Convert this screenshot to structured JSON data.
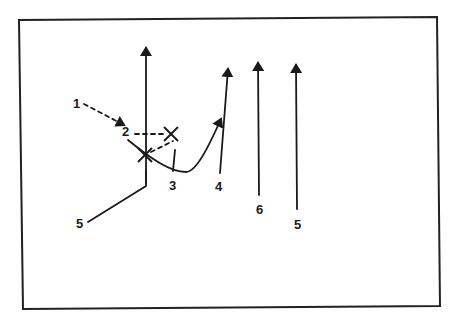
{
  "diagram": {
    "type": "play-diagram",
    "colors": {
      "ink": "#1a1a1a",
      "frame": "#222222",
      "background": "#ffffff"
    },
    "frame": {
      "x1": 19,
      "y1": 20,
      "x2": 439,
      "y2": 307
    },
    "labels": [
      {
        "id": "label-1",
        "text": "1",
        "x": 73,
        "y": 108
      },
      {
        "id": "label-2",
        "text": "2",
        "x": 122,
        "y": 136
      },
      {
        "id": "label-3",
        "text": "3",
        "x": 169,
        "y": 190
      },
      {
        "id": "label-4",
        "text": "4",
        "x": 215,
        "y": 191
      },
      {
        "id": "label-5-left",
        "text": "5",
        "x": 76,
        "y": 228
      },
      {
        "id": "label-6",
        "text": "6",
        "x": 256,
        "y": 214
      },
      {
        "id": "label-5-right",
        "text": "5",
        "x": 294,
        "y": 229
      }
    ],
    "markers": [
      {
        "id": "x-marker-lower",
        "symbol": "X",
        "x": 145,
        "y": 155
      },
      {
        "id": "x-marker-upper",
        "symbol": "X",
        "x": 171,
        "y": 134
      }
    ],
    "routes": [
      {
        "id": "route-1-dashed",
        "style": "dashed",
        "arrow": true,
        "path": "M 84 104 L 124 125"
      },
      {
        "id": "route-2-dashed-horizontal",
        "style": "dashed",
        "arrow": false,
        "path": "M 135 134 L 165 134"
      },
      {
        "id": "route-x-to-x-dashed",
        "style": "dashed",
        "arrow": false,
        "path": "M 151 152 L 173 141"
      },
      {
        "id": "route-vertical-center",
        "style": "solid",
        "arrow": true,
        "path": "M 146 183 L 146 48"
      },
      {
        "id": "route-5-left",
        "style": "solid",
        "arrow": false,
        "path": "M 88 222 L 146 186 L 146 170"
      },
      {
        "id": "route-2-curve",
        "style": "solid",
        "arrow": true,
        "path": "M 128 140 C 150 158, 170 172, 186 172 C 196 172, 208 148, 221 119"
      },
      {
        "id": "route-3-stem",
        "style": "solid",
        "arrow": false,
        "path": "M 173 171 L 175 150"
      },
      {
        "id": "route-4",
        "style": "solid",
        "arrow": true,
        "path": "M 220 173 L 228 69"
      },
      {
        "id": "route-6",
        "style": "solid",
        "arrow": true,
        "path": "M 259 195 L 258 63"
      },
      {
        "id": "route-5-right",
        "style": "solid",
        "arrow": true,
        "path": "M 297 209 L 296 65"
      }
    ]
  }
}
